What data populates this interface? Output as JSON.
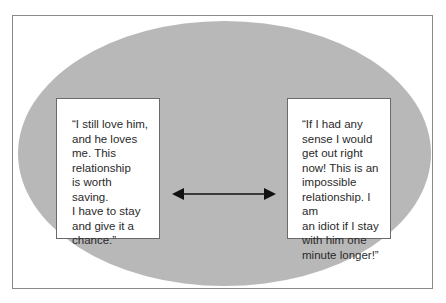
{
  "diagram": {
    "left_quote": "“I still love him,\nand he loves\nme. This\nrelationship\nis worth saving.\nI have to stay\nand give it a\nchance.”",
    "right_quote": "“If I had any\nsense I would\nget out right\nnow! This is an\nimpossible\nrelationship. I am\nan idiot if I stay\nwith him one\nminute longer!”",
    "connector": "double-headed-arrow",
    "colors": {
      "ellipse": "#b8b8b8",
      "border": "#8a8a8a",
      "text": "#2a2a2a"
    }
  }
}
